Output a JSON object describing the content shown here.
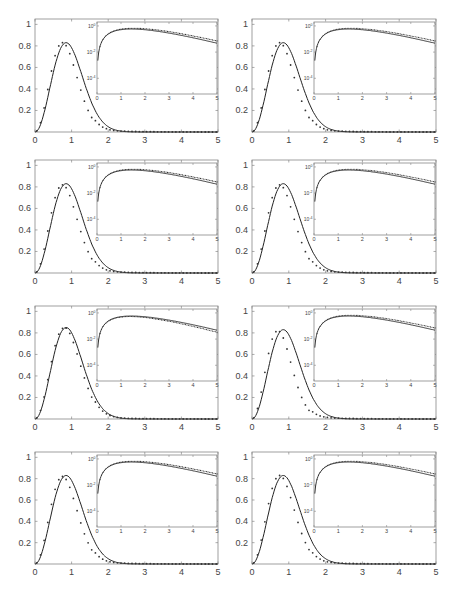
{
  "figure": {
    "layout": {
      "rows": 4,
      "cols": 2
    },
    "curve_color": "#222222",
    "dot_color": "#333333",
    "frame_color": "#888888"
  },
  "chart_data": [
    {
      "panel": 1,
      "type": "line",
      "title": "",
      "xlabel": "",
      "ylabel": "",
      "xlim": [
        0,
        5
      ],
      "ylim": [
        0,
        1.05
      ],
      "xticks": [
        "0",
        "1",
        "2",
        "3",
        "4",
        "5"
      ],
      "yticks": [
        "0.2",
        "0.4",
        "0.6",
        "0.8",
        "1"
      ],
      "series": [
        {
          "name": "theory",
          "style": "solid",
          "peak": {
            "x": 0.85,
            "y": 0.83
          }
        },
        {
          "name": "data",
          "style": "dots",
          "x": [
            0.05,
            0.15,
            0.25,
            0.35,
            0.45,
            0.55,
            0.65,
            0.75,
            0.85,
            0.95,
            1.05,
            1.15,
            1.25,
            1.35,
            1.45,
            1.55,
            1.65,
            1.75,
            1.85,
            1.95,
            2.1,
            2.3,
            2.5,
            2.7,
            2.9,
            3.2,
            3.5,
            4.0,
            4.5,
            5.0
          ],
          "values": [
            0.07,
            0.2,
            0.35,
            0.5,
            0.63,
            0.73,
            0.8,
            0.83,
            0.82,
            0.77,
            0.68,
            0.58,
            0.47,
            0.37,
            0.29,
            0.22,
            0.17,
            0.13,
            0.1,
            0.08,
            0.06,
            0.04,
            0.03,
            0.02,
            0.01,
            0.01,
            0.005,
            0.002,
            0.001,
            0.0
          ]
        }
      ],
      "inset": {
        "type": "line",
        "yscale": "log",
        "xlim": [
          0,
          5
        ],
        "xticks": [
          "0",
          "1",
          "2",
          "3",
          "4",
          "5"
        ],
        "yticks": [
          "10^0",
          "10^-2",
          "10^-4"
        ],
        "dots_relative": "above_tail"
      }
    },
    {
      "panel": 2,
      "type": "line",
      "xlim": [
        0,
        5
      ],
      "ylim": [
        0,
        1.05
      ],
      "xticks": [
        "0",
        "1",
        "2",
        "3",
        "4",
        "5"
      ],
      "yticks": [
        "0.2",
        "0.4",
        "0.6",
        "0.8",
        "1"
      ],
      "series": [
        {
          "name": "theory",
          "style": "solid",
          "peak": {
            "x": 0.85,
            "y": 0.83
          }
        },
        {
          "name": "data",
          "style": "dots",
          "peak": {
            "x": 0.75,
            "y": 0.83
          }
        }
      ],
      "inset": {
        "yscale": "log",
        "xticks": [
          "0",
          "1",
          "2",
          "3",
          "4",
          "5"
        ],
        "yticks": [
          "10^0",
          "10^-2",
          "10^-4"
        ],
        "dots_relative": "above_tail"
      }
    },
    {
      "panel": 3,
      "type": "line",
      "xlim": [
        0,
        5
      ],
      "ylim": [
        0,
        1.05
      ],
      "xticks": [
        "0",
        "1",
        "2",
        "3",
        "4",
        "5"
      ],
      "yticks": [
        "0.2",
        "0.4",
        "0.6",
        "0.8",
        "1"
      ],
      "series": [
        {
          "name": "theory",
          "style": "solid",
          "peak": {
            "x": 0.85,
            "y": 0.83
          }
        },
        {
          "name": "data",
          "style": "dots",
          "peak": {
            "x": 0.75,
            "y": 0.82
          }
        }
      ],
      "inset": {
        "yscale": "log",
        "xticks": [
          "0",
          "1",
          "2",
          "3",
          "4",
          "5"
        ],
        "yticks": [
          "10^0",
          "10^-2",
          "10^-4"
        ],
        "dots_relative": "above_tail"
      }
    },
    {
      "panel": 4,
      "type": "line",
      "xlim": [
        0,
        5
      ],
      "ylim": [
        0,
        1.05
      ],
      "xticks": [
        "0",
        "1",
        "2",
        "3",
        "4",
        "5"
      ],
      "yticks": [
        "0.2",
        "0.4",
        "0.6",
        "0.8",
        "1"
      ],
      "series": [
        {
          "name": "theory",
          "style": "solid",
          "peak": {
            "x": 0.85,
            "y": 0.83
          }
        },
        {
          "name": "data",
          "style": "dots",
          "peak": {
            "x": 0.75,
            "y": 0.82
          }
        }
      ],
      "inset": {
        "yscale": "log",
        "xticks": [
          "0",
          "1",
          "2",
          "3",
          "4",
          "5"
        ],
        "yticks": [
          "10^0",
          "10^-2",
          "10^-4"
        ],
        "dots_relative": "above_tail"
      }
    },
    {
      "panel": 5,
      "type": "line",
      "xlim": [
        0,
        5
      ],
      "ylim": [
        0,
        1.05
      ],
      "xticks": [
        "0",
        "1",
        "2",
        "3",
        "4",
        "5"
      ],
      "yticks": [
        "0.2",
        "0.4",
        "0.6",
        "0.8",
        "1"
      ],
      "series": [
        {
          "name": "theory",
          "style": "solid",
          "peak": {
            "x": 0.85,
            "y": 0.85
          }
        },
        {
          "name": "data",
          "style": "dots",
          "peak": {
            "x": 0.8,
            "y": 0.85
          }
        }
      ],
      "inset": {
        "yscale": "log",
        "xticks": [
          "0",
          "1",
          "2",
          "3",
          "4",
          "5"
        ],
        "yticks": [
          "10^0",
          "10^-2",
          "10^-4"
        ],
        "dots_relative": "below_tail"
      }
    },
    {
      "panel": 6,
      "type": "line",
      "xlim": [
        0,
        5
      ],
      "ylim": [
        0,
        1.05
      ],
      "xticks": [
        "0",
        "1",
        "2",
        "3",
        "4",
        "5"
      ],
      "yticks": [
        "0.2",
        "0.4",
        "0.6",
        "0.8",
        "1"
      ],
      "series": [
        {
          "name": "theory",
          "style": "solid",
          "peak": {
            "x": 0.85,
            "y": 0.83
          }
        },
        {
          "name": "data",
          "style": "dots",
          "peak": {
            "x": 0.7,
            "y": 0.82
          }
        }
      ],
      "inset": {
        "yscale": "log",
        "xticks": [
          "0",
          "1",
          "2",
          "3",
          "4",
          "5"
        ],
        "yticks": [
          "10^0",
          "10^-2",
          "10^-4"
        ],
        "dots_relative": "above_tail"
      }
    },
    {
      "panel": 7,
      "type": "line",
      "xlim": [
        0,
        5
      ],
      "ylim": [
        0,
        1.05
      ],
      "xticks": [
        "0",
        "1",
        "2",
        "3",
        "4",
        "5"
      ],
      "yticks": [
        "0.2",
        "0.4",
        "0.6",
        "0.8",
        "1"
      ],
      "series": [
        {
          "name": "theory",
          "style": "solid",
          "peak": {
            "x": 0.85,
            "y": 0.83
          }
        },
        {
          "name": "data",
          "style": "dots",
          "peak": {
            "x": 0.75,
            "y": 0.82
          }
        }
      ],
      "inset": {
        "yscale": "log",
        "xticks": [
          "0",
          "1",
          "2",
          "3",
          "4",
          "5"
        ],
        "yticks": [
          "10^0",
          "10^-2",
          "10^-4"
        ],
        "dots_relative": "above_tail"
      }
    },
    {
      "panel": 8,
      "type": "line",
      "xlim": [
        0,
        5
      ],
      "ylim": [
        0,
        1.05
      ],
      "xticks": [
        "0",
        "1",
        "2",
        "3",
        "4",
        "5"
      ],
      "yticks": [
        "0.2",
        "0.4",
        "0.6",
        "0.8",
        "1"
      ],
      "series": [
        {
          "name": "theory",
          "style": "solid",
          "peak": {
            "x": 0.85,
            "y": 0.83
          }
        },
        {
          "name": "data",
          "style": "dots",
          "peak": {
            "x": 0.75,
            "y": 0.83
          }
        }
      ],
      "inset": {
        "yscale": "log",
        "xticks": [
          "0",
          "1",
          "2",
          "3",
          "4",
          "5"
        ],
        "yticks": [
          "10^0",
          "10^-2",
          "10^-4"
        ],
        "dots_relative": "above_tail"
      }
    }
  ]
}
